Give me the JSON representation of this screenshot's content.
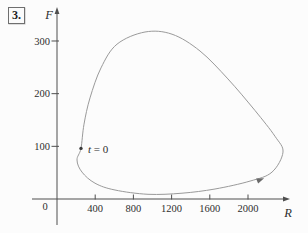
{
  "figure": {
    "problem_number": "3."
  },
  "chart_data": {
    "type": "line",
    "title": "",
    "subtitle": "",
    "xlabel": "R",
    "ylabel": "F",
    "xlim": [
      0,
      2430
    ],
    "ylim": [
      0,
      360
    ],
    "x_ticks": [
      400,
      800,
      1200,
      1600,
      2000
    ],
    "y_ticks": [
      100,
      200,
      300
    ],
    "origin_label": "0",
    "grid": false,
    "legend": "none",
    "curve_points": [
      [
        251,
        96
      ],
      [
        283,
        142
      ],
      [
        346,
        192
      ],
      [
        461,
        249
      ],
      [
        628,
        294
      ],
      [
        921,
        317
      ],
      [
        1204,
        313
      ],
      [
        1497,
        281
      ],
      [
        1790,
        228
      ],
      [
        2073,
        168
      ],
      [
        2283,
        119
      ],
      [
        2366,
        89
      ],
      [
        2251,
        51
      ],
      [
        2021,
        34
      ],
      [
        1654,
        19
      ],
      [
        1309,
        11
      ],
      [
        953,
        9
      ],
      [
        607,
        17
      ],
      [
        398,
        30
      ],
      [
        262,
        51
      ],
      [
        209,
        74
      ]
    ],
    "t0_point": [
      251,
      96
    ],
    "annotations": [
      {
        "text": "t = 0",
        "R": 325,
        "F": 88
      }
    ],
    "direction_arrow": {
      "R": 2120,
      "F": 36,
      "angle_deg": -22
    },
    "colors": {
      "curve": "#9a9a9a",
      "axis": "#4f4f4f",
      "text": "#2e2e2e",
      "point": "#3a3a3a"
    }
  }
}
